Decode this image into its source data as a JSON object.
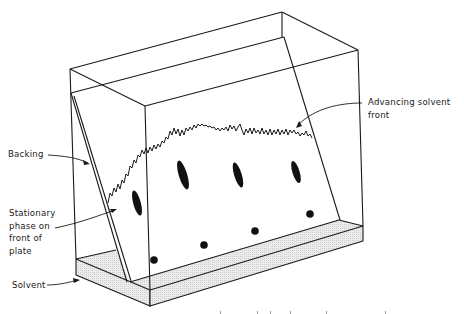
{
  "figure": {
    "type": "thin-layer chromatography developing tank",
    "labels": {
      "advancing_solvent_front": "Advancing solvent\nfront",
      "backing": "Backing",
      "stationary_phase": "Stationary\nphase on\nfront of\nplate",
      "solvent": "Solvent"
    },
    "colors": {
      "line": "#1a1a1a",
      "solvent_fill": "#e6e6e6",
      "spot": "#111111",
      "background": "#ffffff"
    },
    "spots": {
      "origin_spots": [
        {
          "cx": 154,
          "cy": 260,
          "r": 3.8
        },
        {
          "cx": 204,
          "cy": 245,
          "r": 3.8
        },
        {
          "cx": 255,
          "cy": 231,
          "r": 3.8
        },
        {
          "cx": 310,
          "cy": 214,
          "r": 3.8
        }
      ],
      "developed_spots": [
        {
          "cx": 137,
          "cy": 203,
          "rx": 3.8,
          "ry": 13,
          "rotate": -15
        },
        {
          "cx": 183,
          "cy": 175,
          "rx": 4.2,
          "ry": 15,
          "rotate": -17
        },
        {
          "cx": 238,
          "cy": 175,
          "rx": 3.8,
          "ry": 13,
          "rotate": -17
        },
        {
          "cx": 296,
          "cy": 172,
          "rx": 3.6,
          "ry": 11.5,
          "rotate": -17
        }
      ]
    }
  }
}
